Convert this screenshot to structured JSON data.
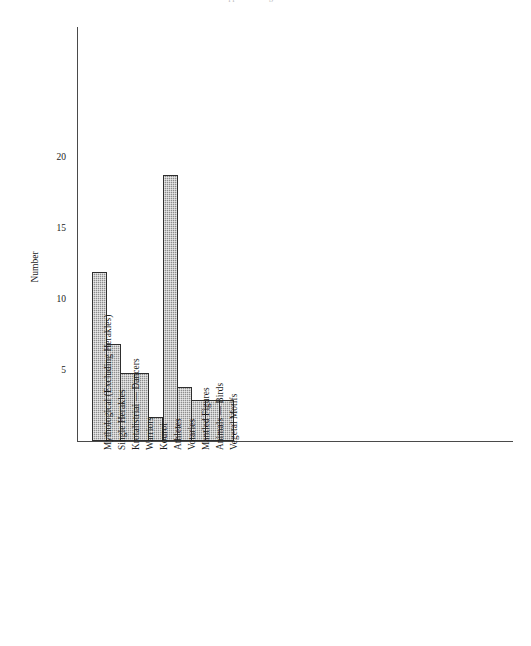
{
  "top_caption": "Clipped running header text",
  "chart_data": {
    "type": "bar",
    "title": "",
    "subtitle": "",
    "xlabel": "",
    "ylabel": "Number",
    "categories": [
      "Mythological (Excluding Herakles)",
      "Single Herakles",
      "Krotalistriai — Dancers",
      "Warriors",
      "Kouroi",
      "Athletes",
      "Votaries",
      "Mantled Figures",
      "Animals — Birds",
      "Vegetal Motifs"
    ],
    "values": [
      11.9,
      6.8,
      4.8,
      4.8,
      1.7,
      18.7,
      3.8,
      2.9,
      2.9,
      2.9
    ],
    "ylim": [
      0,
      29.2
    ],
    "y_ticks": [
      5,
      10,
      15,
      20
    ],
    "y_tick_labels": [
      "5",
      "10",
      "15",
      "20"
    ],
    "grid": false,
    "legend": false,
    "bar_color": "#8d8d8d",
    "bar_edge_color": "#2e2e2e",
    "axis_color": "#4a4a4a"
  }
}
